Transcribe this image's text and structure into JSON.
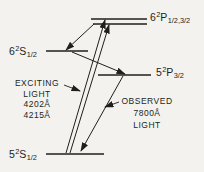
{
  "figure": {
    "kind": "atomic-energy-level-diagram",
    "background_color": "#f4f2ee",
    "ink_color": "#211f1c"
  },
  "levels": {
    "p6": {
      "base": "6",
      "sup": "2",
      "letter": "P",
      "sub": "1/2,3/2"
    },
    "s6": {
      "base": "6",
      "sup": "2",
      "letter": "S",
      "sub": "1/2"
    },
    "p5": {
      "base": "5",
      "sup": "2",
      "letter": "P",
      "sub": "3/2"
    },
    "s5": {
      "base": "5",
      "sup": "2",
      "letter": "S",
      "sub": "1/2"
    }
  },
  "annotations": {
    "exciting": {
      "line1": "EXCITING",
      "line2": "LIGHT",
      "line3": "4202Å",
      "line4": "4215Å"
    },
    "observed": {
      "line1": "OBSERVED",
      "line2": "7800Å",
      "line3": "LIGHT"
    }
  },
  "transitions": [
    {
      "name": "excitation-1",
      "from": "5S1/2",
      "to": "6P",
      "wavelength": "4202Å"
    },
    {
      "name": "excitation-2",
      "from": "5S1/2",
      "to": "6P",
      "wavelength": "4215Å"
    },
    {
      "name": "cascade-1",
      "from": "6P",
      "to": "6S1/2"
    },
    {
      "name": "cascade-2",
      "from": "6S1/2",
      "to": "5P3/2"
    },
    {
      "name": "emission",
      "from": "5P3/2",
      "to": "5S1/2",
      "wavelength": "7800Å"
    }
  ]
}
